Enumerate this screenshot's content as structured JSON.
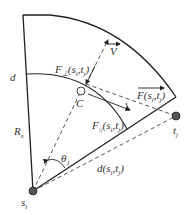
{
  "diagram": {
    "type": "sector-geometry",
    "colors": {
      "line": "#222222",
      "node": "#555555",
      "background": "#ffffff"
    },
    "nodes": {
      "source": {
        "label": "s",
        "sub": "i"
      },
      "target": {
        "label": "t",
        "sub": "j"
      },
      "center": {
        "label": "C"
      }
    },
    "labels": {
      "d": "d",
      "radius": {
        "label": "R",
        "sub": "s"
      },
      "theta": {
        "label": "θ",
        "sub": "1"
      },
      "velocity": "V",
      "f_perp": {
        "label": "F",
        "sub": "⊥",
        "args": "(s",
        "args_sub1": "i",
        "args_mid": ",t",
        "args_sub2": "j",
        "close": ")"
      },
      "f_par": {
        "label": "F",
        "sub": "||",
        "args": "(s",
        "args_sub1": "i",
        "args_mid": ",t",
        "args_sub2": "j",
        "close": ")"
      },
      "f_total": {
        "label": "F",
        "args": "(s",
        "args_sub1": "i",
        "args_mid": ",t",
        "args_sub2": "j",
        "close": ")"
      },
      "dist": {
        "label": "d",
        "args": "(s",
        "args_sub1": "i",
        "args_mid": ",t",
        "args_sub2": "j",
        "close": ")"
      }
    }
  }
}
